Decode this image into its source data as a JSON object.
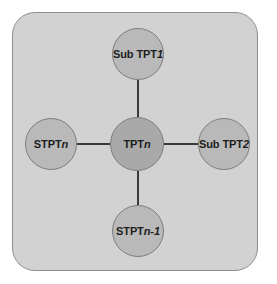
{
  "diagram": {
    "type": "star-topology-node-graph",
    "panel": {
      "fill_color": "#d2d2d2",
      "border_color": "#8e8e8e"
    },
    "edge_color": "#3a3a3a",
    "nodes": [
      {
        "id": "sub-tpt-1",
        "position": "top",
        "label_prefix": "Sub TPT",
        "label_suffix": "1",
        "label_full": "Sub TPT 1",
        "fill_color": "#b9b9b9"
      },
      {
        "id": "stpt-n",
        "position": "left",
        "label_prefix": "STPT",
        "label_suffix": "n",
        "label_full": "STPTn",
        "fill_color": "#b9b9b9"
      },
      {
        "id": "tpt-n",
        "position": "center",
        "label_prefix": "TPT",
        "label_suffix": "n",
        "label_full": "TPTn",
        "fill_color": "#a9a9a9"
      },
      {
        "id": "sub-tpt-2",
        "position": "right",
        "label_prefix": "Sub TPT",
        "label_suffix": "2",
        "label_full": "Sub TPT2",
        "fill_color": "#b9b9b9"
      },
      {
        "id": "stpt-n-1",
        "position": "bottom",
        "label_prefix": "STPT",
        "label_suffix": "n-1",
        "label_full": "STPTn-1",
        "fill_color": "#b9b9b9"
      }
    ],
    "edges": [
      {
        "id": "edge-center-top",
        "from": "tpt-n",
        "to": "sub-tpt-1"
      },
      {
        "id": "edge-center-left",
        "from": "tpt-n",
        "to": "stpt-n"
      },
      {
        "id": "edge-center-right",
        "from": "tpt-n",
        "to": "sub-tpt-2"
      },
      {
        "id": "edge-center-bottom",
        "from": "tpt-n",
        "to": "stpt-n-1"
      }
    ]
  }
}
